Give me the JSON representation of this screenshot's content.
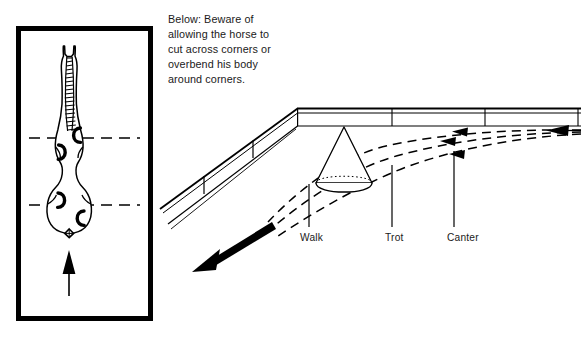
{
  "figure": {
    "caption": "Below: Beware of\nallowing the horse to\ncut across corners or\noverbend his body\naround corners.",
    "ink_color": "#000000",
    "background_color": "#ffffff"
  },
  "horse_panel": {
    "title": "overhead view of horse with alignment lines",
    "frame": {
      "border_color": "#000000",
      "border_width_px": 5,
      "fill": "#ffffff"
    },
    "horse": {
      "view": "top-down",
      "outline_color": "#000000",
      "mane_shading": "hatched",
      "ears": 2,
      "hooves": 4,
      "tail": "small diamond at hindquarters"
    },
    "guide_lines": {
      "shoulder_line": {
        "style": "dashed",
        "orientation": "horizontal"
      },
      "hip_line": {
        "style": "dashed",
        "orientation": "horizontal"
      },
      "center_line": {
        "style": "dash-dot",
        "orientation": "vertical"
      }
    },
    "direction_arrow": {
      "name": "direction-of-travel-arrow",
      "points": "up",
      "fill": "#000000"
    }
  },
  "arena_panel": {
    "title": "arena corner in perspective with three gait tracks",
    "fence": {
      "rails": 2,
      "posts": 5,
      "corner": "angled junction at top-left of far rail"
    },
    "cone": {
      "name": "marker-cone",
      "base_style": "dotted top arc, solid bottom arc"
    },
    "tracks": [
      {
        "gait": "Walk",
        "style": "dashed",
        "arrowheads": 1,
        "note": "tightest line, cuts closest to the corner"
      },
      {
        "gait": "Trot",
        "style": "dashed",
        "arrowheads": 1,
        "note": "middle line"
      },
      {
        "gait": "Canter",
        "style": "dashed",
        "arrowheads": 1,
        "note": "widest line, furthest from the corner"
      }
    ],
    "entry_arrow": {
      "name": "entry-arrow",
      "points": "left",
      "fill": "#000000"
    },
    "exit_arrow": {
      "name": "exit-arrow",
      "points": "down-left",
      "fill": "#000000"
    },
    "labels": {
      "walk": "Walk",
      "trot": "Trot",
      "canter": "Canter"
    }
  }
}
